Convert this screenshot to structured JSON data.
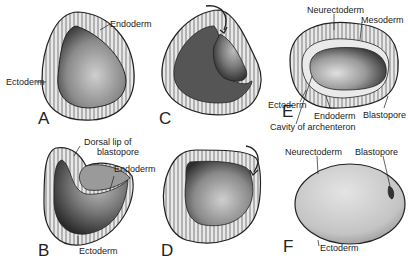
{
  "figure": {
    "panels": [
      {
        "id": "A",
        "label": "A",
        "annotations": [
          "Endoderm",
          "Ectoderm"
        ]
      },
      {
        "id": "B",
        "label": "B",
        "annotations": [
          "Dorsal lip of",
          "blastopore",
          "Endoderm",
          "Ectoderm"
        ]
      },
      {
        "id": "C",
        "label": "C",
        "annotations": []
      },
      {
        "id": "D",
        "label": "D",
        "annotations": []
      },
      {
        "id": "E",
        "label": "E",
        "annotations": [
          "Neurectoderm",
          "Mesoderm",
          "Ectoderm",
          "Endoderm",
          "Blastopore",
          "Cavity of archenteron"
        ]
      },
      {
        "id": "F",
        "label": "F",
        "annotations": [
          "Neurectoderm",
          "Blastopore",
          "Ectoderm"
        ]
      }
    ]
  },
  "labels": {
    "a_endoderm": "Endoderm",
    "a_ectoderm": "Ectoderm",
    "b_dorsal_lip_1": "Dorsal lip of",
    "b_dorsal_lip_2": "blastopore",
    "b_endoderm": "Endoderm",
    "b_ectoderm": "Ectoderm",
    "e_neurectoderm": "Neurectoderm",
    "e_mesoderm": "Mesoderm",
    "e_ectoderm": "Ectoderm",
    "e_endoderm": "Endoderm",
    "e_blastopore": "Blastopore",
    "e_cavity": "Cavity of archenteron",
    "f_neurectoderm": "Neurectoderm",
    "f_blastopore": "Blastopore",
    "f_ectoderm": "Ectoderm"
  },
  "colors": {
    "ink": "#222222",
    "cell_layer": "#e6e6e6",
    "interior_dark": "#3a3a3a",
    "interior_light": "#c8c8c8",
    "egg_fill": "#d4d4d4"
  }
}
